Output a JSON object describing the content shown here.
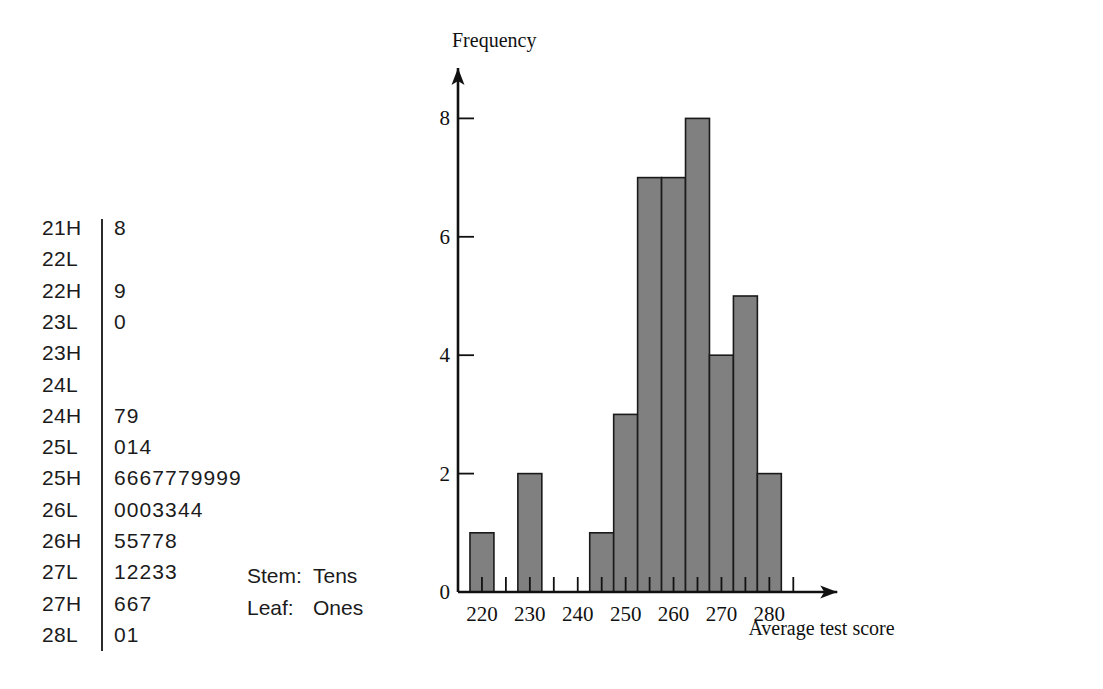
{
  "stem_leaf": {
    "title": "Stem-and-leaf display",
    "divider_color": "#2b2b2b",
    "rows": [
      {
        "stem": "21H",
        "leaf": "8"
      },
      {
        "stem": "22L",
        "leaf": ""
      },
      {
        "stem": "22H",
        "leaf": "9"
      },
      {
        "stem": "23L",
        "leaf": "0"
      },
      {
        "stem": "23H",
        "leaf": ""
      },
      {
        "stem": "24L",
        "leaf": ""
      },
      {
        "stem": "24H",
        "leaf": "79"
      },
      {
        "stem": "25L",
        "leaf": "014"
      },
      {
        "stem": "25H",
        "leaf": "6667779999"
      },
      {
        "stem": "26L",
        "leaf": "0003344"
      },
      {
        "stem": "26H",
        "leaf": "55778"
      },
      {
        "stem": "27L",
        "leaf": "12233"
      },
      {
        "stem": "27H",
        "leaf": "667"
      },
      {
        "stem": "28L",
        "leaf": "01"
      }
    ],
    "legend": [
      {
        "key": "Stem:",
        "value": "Tens"
      },
      {
        "key": "Leaf:",
        "value": "Ones"
      }
    ]
  },
  "chart_data": {
    "type": "bar",
    "title": "",
    "xlabel": "Average test score",
    "ylabel": "Frequency",
    "bin_width": 5,
    "xlim": [
      215,
      287.5
    ],
    "ylim": [
      0,
      8.6
    ],
    "grid": false,
    "legend": "none",
    "bar_fill": "#808080",
    "bar_stroke": "#1a1a1a",
    "axis_color": "#111111",
    "x_tick_values": [
      215,
      220,
      225,
      230,
      235,
      240,
      245,
      250,
      255,
      260,
      265,
      270,
      275,
      280,
      285
    ],
    "x_tick_labels": [
      {
        "value": 220,
        "label": "220"
      },
      {
        "value": 230,
        "label": "230"
      },
      {
        "value": 240,
        "label": "240"
      },
      {
        "value": 250,
        "label": "250"
      },
      {
        "value": 260,
        "label": "260"
      },
      {
        "value": 270,
        "label": "270"
      },
      {
        "value": 280,
        "label": "280"
      }
    ],
    "y_tick_values": [
      0,
      2,
      4,
      6,
      8
    ],
    "y_tick_labels": [
      "0",
      "2",
      "4",
      "6",
      "8"
    ],
    "categories": [
      220,
      225,
      230,
      235,
      240,
      245,
      250,
      255,
      260,
      265,
      270,
      275,
      280
    ],
    "bins": [
      {
        "center": 220,
        "start": 217.5,
        "end": 222.5,
        "value": 1
      },
      {
        "center": 225,
        "start": 222.5,
        "end": 227.5,
        "value": 0
      },
      {
        "center": 230,
        "start": 227.5,
        "end": 232.5,
        "value": 2
      },
      {
        "center": 235,
        "start": 232.5,
        "end": 237.5,
        "value": 0
      },
      {
        "center": 240,
        "start": 237.5,
        "end": 242.5,
        "value": 0
      },
      {
        "center": 245,
        "start": 242.5,
        "end": 247.5,
        "value": 1
      },
      {
        "center": 250,
        "start": 247.5,
        "end": 252.5,
        "value": 3
      },
      {
        "center": 255,
        "start": 252.5,
        "end": 257.5,
        "value": 7
      },
      {
        "center": 260,
        "start": 257.5,
        "end": 262.5,
        "value": 7
      },
      {
        "center": 265,
        "start": 262.5,
        "end": 267.5,
        "value": 8
      },
      {
        "center": 270,
        "start": 267.5,
        "end": 272.5,
        "value": 4
      },
      {
        "center": 275,
        "start": 272.5,
        "end": 277.5,
        "value": 5
      },
      {
        "center": 280,
        "start": 277.5,
        "end": 282.5,
        "value": 2
      }
    ],
    "values": [
      1,
      0,
      2,
      0,
      0,
      1,
      3,
      7,
      7,
      8,
      4,
      5,
      2
    ]
  }
}
